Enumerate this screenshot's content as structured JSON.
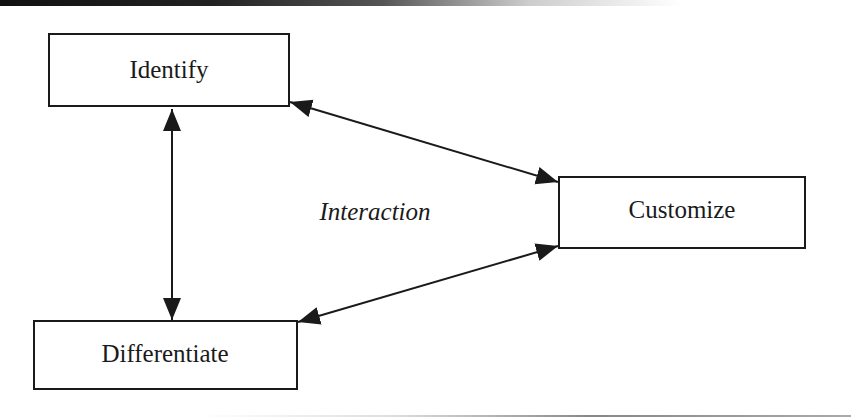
{
  "diagram": {
    "nodes": [
      {
        "id": "identify",
        "label": "Identify"
      },
      {
        "id": "customize",
        "label": "Customize"
      },
      {
        "id": "differentiate",
        "label": "Differentiate"
      }
    ],
    "center_label": "Interaction",
    "edges": [
      {
        "from": "identify",
        "to": "differentiate",
        "direction": "bidirectional"
      },
      {
        "from": "identify",
        "to": "customize",
        "direction": "bidirectional"
      },
      {
        "from": "differentiate",
        "to": "customize",
        "direction": "bidirectional"
      }
    ],
    "colors": {
      "stroke": "#1a1a1a",
      "background": "#ffffff"
    }
  }
}
